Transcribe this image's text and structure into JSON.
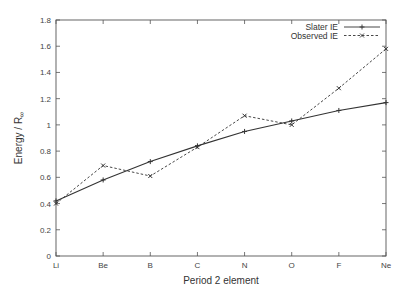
{
  "chart_data": {
    "type": "line",
    "title": "",
    "xlabel": "Period 2 element",
    "ylabel": "Energy / R",
    "ylabel_subscript": "∞",
    "categories": [
      "Li",
      "Be",
      "B",
      "C",
      "N",
      "O",
      "F",
      "Ne"
    ],
    "ylim": [
      0,
      1.8
    ],
    "yticks": [
      0,
      0.2,
      0.4,
      0.6,
      0.8,
      1,
      1.2,
      1.4,
      1.6,
      1.8
    ],
    "ytick_labels": [
      "0",
      "0.2",
      "0.4",
      "0.6",
      "0.8",
      "1",
      "1.2",
      "1.4",
      "1.6",
      "1.8"
    ],
    "grid": false,
    "legend_position": "top-right",
    "series": [
      {
        "name": "Slater IE",
        "style": "solid",
        "marker": "plus",
        "color": "#333333",
        "values": [
          0.42,
          0.58,
          0.72,
          0.84,
          0.95,
          1.03,
          1.11,
          1.17
        ]
      },
      {
        "name": "Observed IE",
        "style": "dashed",
        "marker": "x",
        "color": "#333333",
        "values": [
          0.4,
          0.69,
          0.61,
          0.83,
          1.07,
          1.0,
          1.28,
          1.58
        ]
      }
    ]
  }
}
